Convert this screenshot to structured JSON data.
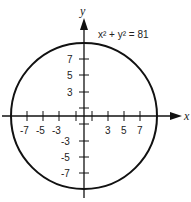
{
  "diagram": {
    "equation": "x² + y² = 81",
    "axis_labels": {
      "x": "x",
      "y": "y"
    },
    "center": [
      0,
      0
    ],
    "radius": 9,
    "x_ticks_labeled": [
      "-7",
      "-5",
      "-3",
      "3",
      "5",
      "7"
    ],
    "y_ticks_labeled": [
      "7",
      "5",
      "3",
      "-3",
      "-5",
      "-7"
    ],
    "colors": {
      "stroke": "#111111",
      "text": "#222222",
      "background": "#ffffff"
    }
  }
}
